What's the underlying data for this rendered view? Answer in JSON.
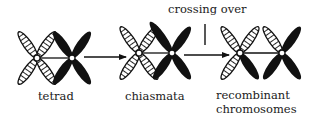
{
  "diagram": {
    "title_annotation": "crossing over",
    "stages": [
      {
        "id": "tetrad",
        "label": "tetrad"
      },
      {
        "id": "chiasmata",
        "label": "chiasmata"
      },
      {
        "id": "recombinant",
        "label_line1": "recombinant",
        "label_line2": "chromosomes"
      }
    ],
    "colors": {
      "ink": "#111111",
      "background": "#ffffff"
    },
    "legend_patterns": {
      "hatched": "maternal chromatid (hatched)",
      "solid": "paternal chromatid (solid black)"
    }
  }
}
